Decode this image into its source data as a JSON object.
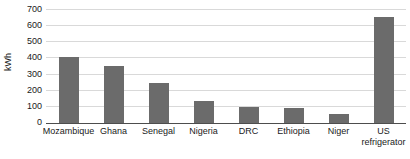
{
  "chart_data": {
    "type": "bar",
    "title": "",
    "subtitle": "",
    "xlabel": "",
    "ylabel": "kWh",
    "categories": [
      "Mozambique",
      "Ghana",
      "Senegal",
      "Nigeria",
      "DRC",
      "Ethiopia",
      "Niger",
      "US refrigerator"
    ],
    "category_lines": [
      [
        "Mozambique"
      ],
      [
        "Ghana"
      ],
      [
        "Senegal"
      ],
      [
        "Nigeria"
      ],
      [
        "DRC"
      ],
      [
        "Ethiopia"
      ],
      [
        "Niger"
      ],
      [
        "US",
        "refrigerator"
      ]
    ],
    "values": [
      410,
      355,
      245,
      135,
      100,
      95,
      55,
      655
    ],
    "ylim": [
      0,
      700
    ],
    "yticks": [
      0,
      100,
      200,
      300,
      400,
      500,
      600,
      700
    ],
    "ytick_labels": [
      "0",
      "100",
      "200",
      "300",
      "400",
      "500",
      "600",
      "700"
    ],
    "grid": true,
    "grid_axis": "y",
    "legend": false,
    "legend_position": "none",
    "bar_color": "#6b6b6b",
    "gridline_color": "#d9d9d9",
    "axis_color": "#4d4d4d",
    "text_color": "#1a1a1a",
    "background": "#ffffff"
  }
}
